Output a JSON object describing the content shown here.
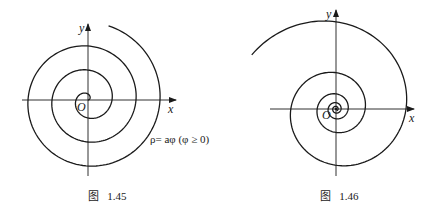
{
  "figures": [
    {
      "id": "fig-1-45",
      "caption": "图   1.45",
      "curve": "Archimedean spiral",
      "equation": "ρ= aφ (φ ≥ 0)",
      "axes": {
        "x_label": "x",
        "y_label": "y",
        "origin_label": "O"
      }
    },
    {
      "id": "fig-1-46",
      "caption": "图   1.46",
      "curve": "logarithmic spiral",
      "axes": {
        "x_label": "x",
        "y_label": "y",
        "origin_label": "O"
      }
    }
  ],
  "colors": {
    "ink": "#1a1a1a",
    "background": "#ffffff"
  }
}
